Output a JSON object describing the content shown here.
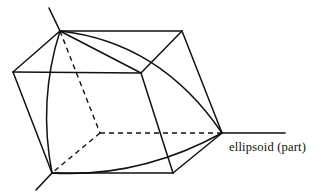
{
  "figure": {
    "title": "ellipsoid (part)",
    "background_color": "#ffffff",
    "ink_color": "#111111",
    "width": 324,
    "height": 192,
    "labels": {
      "ellipsoid_part": "ellipsoid (part)"
    },
    "geometry": {
      "description": "Parallelepiped (box) drawn in oblique projection with three coordinate axes emanating from hidden interior vertex, containing one octant of an ellipsoid surface.",
      "vertices": {
        "top": [
          60,
          31
        ],
        "top_right": [
          182,
          31
        ],
        "left": [
          13,
          72
        ],
        "front_top_right": [
          141,
          73
        ],
        "hidden_center": [
          100,
          133
        ],
        "right": [
          222,
          133
        ],
        "bottom_left": [
          52,
          173
        ],
        "bottom_right": [
          173,
          173
        ]
      },
      "axis_tips": {
        "up_left": [
          49,
          8
        ],
        "down_left": [
          36,
          190
        ],
        "right": [
          285,
          133
        ]
      },
      "solid_edges": [
        [
          [
            60,
            31
          ],
          [
            182,
            31
          ]
        ],
        [
          [
            60,
            31
          ],
          [
            13,
            72
          ]
        ],
        [
          [
            13,
            72
          ],
          [
            141,
            73
          ]
        ],
        [
          [
            141,
            73
          ],
          [
            60,
            31
          ]
        ],
        [
          [
            182,
            31
          ],
          [
            222,
            133
          ]
        ],
        [
          [
            141,
            73
          ],
          [
            182,
            31
          ]
        ],
        [
          [
            13,
            72
          ],
          [
            52,
            173
          ]
        ],
        [
          [
            52,
            173
          ],
          [
            173,
            173
          ]
        ],
        [
          [
            173,
            173
          ],
          [
            222,
            133
          ]
        ],
        [
          [
            141,
            73
          ],
          [
            173,
            173
          ]
        ]
      ],
      "dashed_edges": [
        [
          [
            60,
            31
          ],
          [
            100,
            133
          ]
        ],
        [
          [
            100,
            133
          ],
          [
            52,
            173
          ]
        ],
        [
          [
            100,
            133
          ],
          [
            222,
            133
          ]
        ]
      ],
      "axis_segments": [
        [
          [
            60,
            31
          ],
          [
            49,
            8
          ]
        ],
        [
          [
            52,
            173
          ],
          [
            36,
            190
          ]
        ],
        [
          [
            222,
            133
          ],
          [
            285,
            133
          ]
        ]
      ],
      "ellipse_arcs": [
        {
          "name": "arc-left-meridian",
          "from": [
            60,
            31
          ],
          "to": [
            52,
            173
          ],
          "bulge_point": [
            44,
            103
          ]
        },
        {
          "name": "arc-upper-meridian",
          "from": [
            60,
            31
          ],
          "to": [
            222,
            133
          ],
          "bulge_point": [
            150,
            62
          ]
        },
        {
          "name": "arc-lower-equator",
          "from": [
            52,
            173
          ],
          "to": [
            222,
            133
          ],
          "bulge_point": [
            140,
            170
          ]
        }
      ]
    }
  }
}
